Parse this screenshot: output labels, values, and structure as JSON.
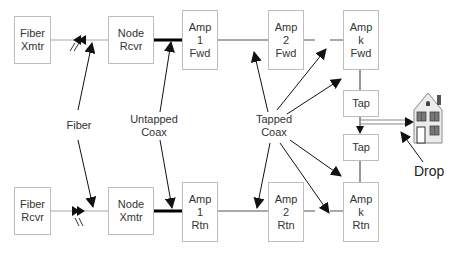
{
  "diagram": {
    "type": "HFC cable network block diagram",
    "boxes": {
      "fiber_xmtr": "Fiber\nXmtr",
      "node_rcvr": "Node\nRcvr",
      "amp1_fwd": "Amp\n1\nFwd",
      "amp2_fwd": "Amp\n2\nFwd",
      "ampk_fwd": "Amp\nk\nFwd",
      "tap_upper": "Tap",
      "tap_lower": "Tap",
      "fiber_rcvr": "Fiber\nRcvr",
      "node_xmtr": "Node\nXmtr",
      "amp1_rtn": "Amp\n1\nRtn",
      "amp2_rtn": "Amp\n2\nRtn",
      "ampk_rtn": "Amp\nk\nRtn"
    },
    "labels": {
      "fiber": "Fiber",
      "untapped_coax": "Untapped\nCoax",
      "tapped_coax": "Tapped\nCoax",
      "drop": "Drop"
    },
    "colors": {
      "box_border": "#bdbdbd",
      "line": "#9e9e9e",
      "thick_line": "#000000",
      "arrow": "#111111"
    }
  }
}
